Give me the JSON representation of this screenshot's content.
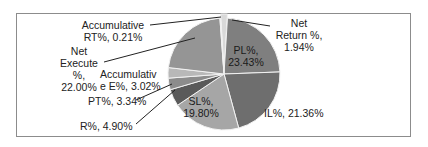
{
  "chart_data": {
    "type": "pie",
    "title": "",
    "categories": [
      "Net Return %",
      "PL%",
      "IL%",
      "SL%",
      "R%",
      "PT%",
      "Accumulative E%",
      "Net Execute %",
      "Accumulative RT%"
    ],
    "values": [
      1.94,
      23.43,
      21.36,
      19.8,
      4.9,
      3.34,
      3.02,
      22.0,
      0.21
    ],
    "unit": "%",
    "legend": "none (data labels with leader lines)",
    "colors": [
      "#d9d9d9",
      "#7f7f7f",
      "#6e6e6e",
      "#a6a6a6",
      "#5a5a5a",
      "#8c8c8c",
      "#b8b8b8",
      "#959595",
      "#e6e6e6"
    ],
    "start_angle_deg": 0,
    "direction": "clockwise",
    "exploded": [
      "Net Return %"
    ]
  },
  "labels": {
    "net_return_1": "Net",
    "net_return_2": "Return %,",
    "net_return_3": "1.94%",
    "pl_1": "PL%,",
    "pl_2": "23.43%",
    "il": "IL%, 21.36%",
    "sl_1": "SL%,",
    "sl_2": "19.80%",
    "r": "R%, 4.90%",
    "pt": "PT%, 3.34%",
    "acc_e_1": "Accumulativ",
    "acc_e_2": "e E%, 3.02%",
    "net_exec_1": "Net",
    "net_exec_2": "Execute",
    "net_exec_3": "%,",
    "net_exec_4": "22.00%",
    "acc_rt_1": "Accumulative",
    "acc_rt_2": "RT%, 0.21%"
  }
}
